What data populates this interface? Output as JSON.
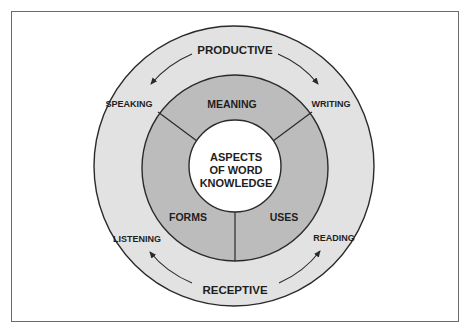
{
  "diagram": {
    "center": {
      "lines": [
        "ASPECTS",
        "OF WORD",
        "KNOWLEDGE"
      ]
    },
    "inner_segments": [
      {
        "label": "MEANING",
        "position": "top"
      },
      {
        "label": "FORMS",
        "position": "bottom-left"
      },
      {
        "label": "USES",
        "position": "bottom-right"
      }
    ],
    "outer_ring": {
      "top_label": "PRODUCTIVE",
      "bottom_label": "RECEPTIVE",
      "skills": [
        {
          "label": "SPEAKING",
          "position": "upper-left"
        },
        {
          "label": "WRITING",
          "position": "upper-right"
        },
        {
          "label": "LISTENING",
          "position": "lower-left"
        },
        {
          "label": "READING",
          "position": "lower-right"
        }
      ]
    },
    "arrows": [
      {
        "from": "PRODUCTIVE",
        "to": "SPEAKING"
      },
      {
        "from": "PRODUCTIVE",
        "to": "WRITING"
      },
      {
        "from": "RECEPTIVE",
        "to": "LISTENING"
      },
      {
        "from": "RECEPTIVE",
        "to": "READING"
      }
    ],
    "colors": {
      "outer_ring": "#e2e2e2",
      "middle_ring": "#bcbcbc",
      "center": "#ffffff",
      "stroke": "#2a2a2a",
      "text": "#1e1e1e",
      "frame": "#6a6a6a"
    }
  }
}
